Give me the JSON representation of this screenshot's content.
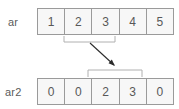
{
  "diagram": {
    "background_color": "#ffffff",
    "cell_fill_color": "#f7f7f7",
    "cell_border_color": "#9a9a9a",
    "text_color": "#585858",
    "label_color": "#5b5b5b",
    "brace_color": "#b0b0b0",
    "arrow_color": "#2b2b2b"
  },
  "rows": [
    {
      "name": "source-array",
      "label": "ar",
      "cells": [
        "1",
        "2",
        "3",
        "4",
        "5"
      ]
    },
    {
      "name": "destination-array",
      "label": "ar2",
      "cells": [
        "0",
        "0",
        "2",
        "3",
        "0"
      ]
    }
  ],
  "annotations": {
    "source_brace": {
      "name": "source-selection-brace",
      "covers_cells": [
        "2",
        "3"
      ],
      "start_index": 1,
      "end_index": 2
    },
    "destination_brace": {
      "name": "destination-selection-brace",
      "covers_cells": [
        "2",
        "3"
      ],
      "start_index": 2,
      "end_index": 3
    },
    "arrow": {
      "name": "copy-arrow",
      "direction": "source-to-destination"
    }
  }
}
